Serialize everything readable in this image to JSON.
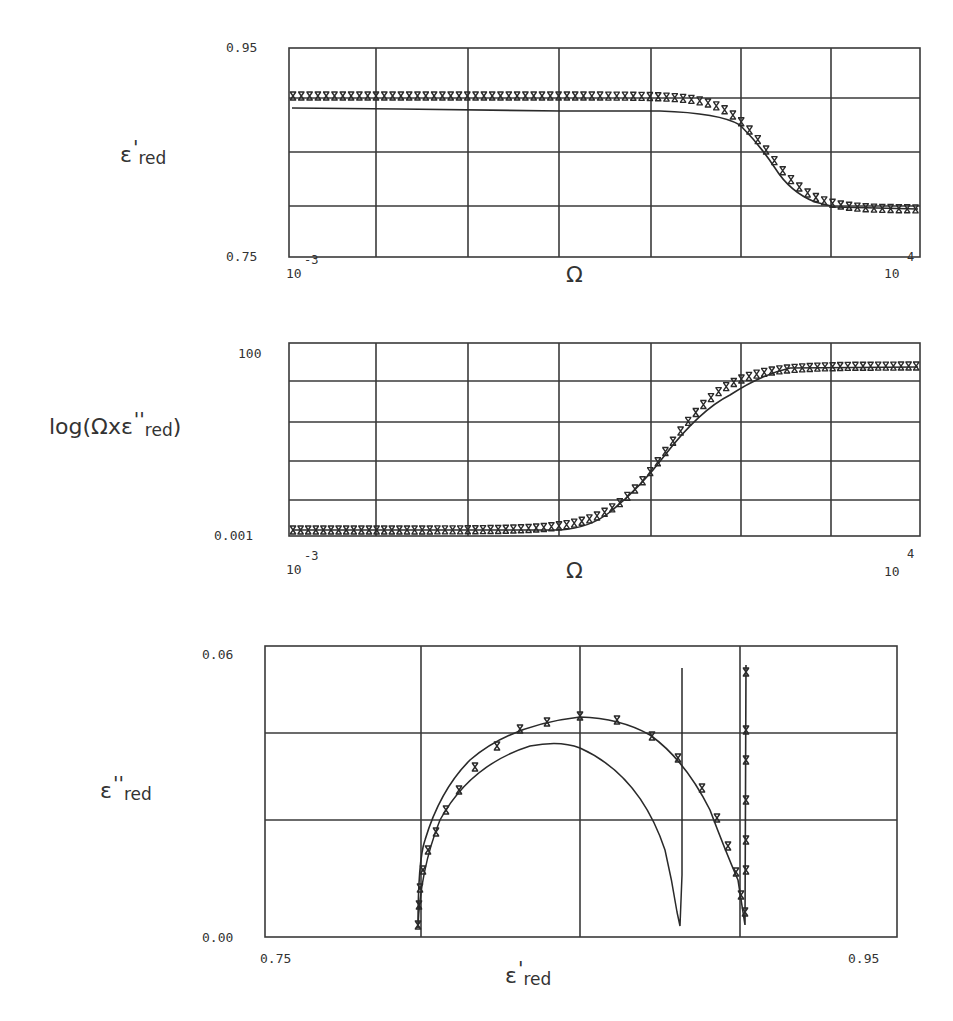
{
  "figure": {
    "panels": [
      {
        "id": "top",
        "ylabel_main": "ε",
        "ylabel_prime": "'",
        "ylabel_sub": "red",
        "y_top_tick": "0.95",
        "y_bottom_tick": "0.75",
        "x_left_base": "10",
        "x_left_exp": "-3",
        "x_right_base": "10",
        "x_right_exp": "4",
        "xlabel": "Ω"
      },
      {
        "id": "middle",
        "ylabel_prefix": "log(Ωxε",
        "ylabel_prime": "''",
        "ylabel_sub": "red",
        "ylabel_suffix": ")",
        "y_top_tick": "100",
        "y_bottom_tick": "0.001",
        "x_left_base": "10",
        "x_left_exp": "-3",
        "x_right_base": "10",
        "x_right_exp": "4",
        "xlabel": "Ω"
      },
      {
        "id": "bottom",
        "ylabel_main": "ε",
        "ylabel_prime": "''",
        "ylabel_sub": "red",
        "y_top_tick": "0.06",
        "y_bottom_tick": "0.00",
        "x_left_tick": "0.75",
        "x_right_tick": "0.95",
        "xlabel_main": "ε",
        "xlabel_prime": "'",
        "xlabel_sub": "red"
      }
    ],
    "colors": {
      "ink": "#2a2a2a",
      "grid": "#3a3a3a",
      "background": "#ffffff"
    }
  },
  "chart_data": [
    {
      "type": "line",
      "title": "",
      "xlabel": "Ω",
      "ylabel": "ε'red",
      "xscale": "log",
      "xlim": [
        0.001,
        10000
      ],
      "ylim": [
        0.75,
        0.95
      ],
      "grid": true,
      "x_ticks": [
        "10^-3",
        "10^4"
      ],
      "y_ticks": [
        "0.75",
        "0.95"
      ],
      "series": [
        {
          "name": "data (x markers)",
          "style": "markers",
          "x_log10": [
            -3,
            -2,
            -1,
            0,
            0.5,
            1,
            1.5,
            2,
            2.25,
            2.5,
            2.75,
            3,
            3.25,
            3.5,
            4
          ],
          "values": [
            0.925,
            0.925,
            0.925,
            0.925,
            0.925,
            0.923,
            0.918,
            0.905,
            0.89,
            0.87,
            0.845,
            0.82,
            0.807,
            0.8,
            0.8
          ]
        },
        {
          "name": "model (solid)",
          "style": "line",
          "x_log10": [
            -3,
            -2,
            -1,
            0,
            0.5,
            1,
            1.5,
            2,
            2.25,
            2.5,
            2.75,
            3,
            3.25,
            3.5,
            4
          ],
          "values": [
            0.906,
            0.905,
            0.904,
            0.904,
            0.904,
            0.903,
            0.898,
            0.885,
            0.87,
            0.85,
            0.83,
            0.812,
            0.803,
            0.8,
            0.8
          ]
        }
      ]
    },
    {
      "type": "line",
      "title": "",
      "xlabel": "Ω",
      "ylabel": "log(Ωxε''red)",
      "xscale": "log",
      "yscale": "log",
      "xlim": [
        0.001,
        10000
      ],
      "ylim": [
        0.001,
        100
      ],
      "grid": true,
      "x_ticks": [
        "10^-3",
        "10^4"
      ],
      "y_ticks": [
        "0.001",
        "100"
      ],
      "series": [
        {
          "name": "data (x markers)",
          "style": "markers",
          "x_log10": [
            -3,
            -2,
            -1,
            0,
            0.5,
            1,
            1.5,
            2,
            2.5,
            3,
            3.5,
            4
          ],
          "values_log10": [
            -2.35,
            -2.35,
            -2.35,
            -2.3,
            -2.0,
            -1.3,
            -0.5,
            0.3,
            1.0,
            1.4,
            1.4,
            1.4
          ]
        },
        {
          "name": "model (solid)",
          "style": "line",
          "x_log10": [
            -3,
            -2,
            -1,
            0,
            0.5,
            1,
            1.5,
            2,
            2.5,
            3,
            3.5,
            4
          ],
          "values_log10": [
            -2.35,
            -2.35,
            -2.35,
            -2.3,
            -2.05,
            -1.4,
            -0.6,
            0.2,
            0.95,
            1.35,
            1.4,
            1.4
          ]
        }
      ]
    },
    {
      "type": "line",
      "title": "",
      "xlabel": "ε'red",
      "ylabel": "ε''red",
      "xlim": [
        0.75,
        0.95
      ],
      "ylim": [
        0.0,
        0.06
      ],
      "grid": true,
      "x_ticks": [
        "0.75",
        "0.95"
      ],
      "y_ticks": [
        "0.00",
        "0.06"
      ],
      "series": [
        {
          "name": "data arc (x markers)",
          "style": "line+markers",
          "x": [
            0.8,
            0.803,
            0.807,
            0.812,
            0.818,
            0.826,
            0.836,
            0.85,
            0.862,
            0.873,
            0.882,
            0.889,
            0.895,
            0.9,
            0.904
          ],
          "y": [
            0.002,
            0.015,
            0.024,
            0.031,
            0.038,
            0.044,
            0.049,
            0.052,
            0.0515,
            0.049,
            0.044,
            0.037,
            0.03,
            0.021,
            0.002
          ]
        },
        {
          "name": "model arc (solid)",
          "style": "line",
          "x": [
            0.8,
            0.804,
            0.81,
            0.82,
            0.83,
            0.845,
            0.856,
            0.865,
            0.874,
            0.881,
            0.886,
            0.888
          ],
          "y": [
            0.002,
            0.015,
            0.025,
            0.034,
            0.039,
            0.042,
            0.041,
            0.036,
            0.028,
            0.018,
            0.006,
            0.002
          ]
        },
        {
          "name": "vertical spike (solid)",
          "style": "line",
          "x": [
            0.888,
            0.889,
            0.889
          ],
          "y": [
            0.002,
            0.002,
            0.052
          ]
        },
        {
          "name": "vertical spike (markers)",
          "style": "line+markers",
          "x": [
            0.904,
            0.906,
            0.906
          ],
          "y": [
            0.002,
            0.002,
            0.053
          ]
        }
      ]
    }
  ]
}
